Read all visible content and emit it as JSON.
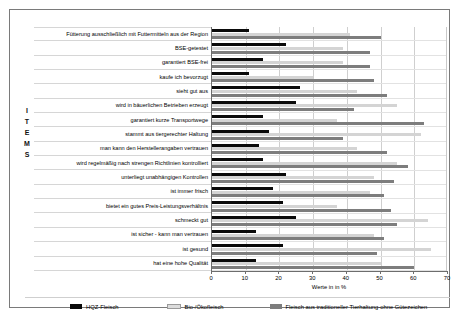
{
  "chart_data": {
    "type": "bar",
    "orientation": "horizontal",
    "title": "",
    "xlabel": "Werte in in %",
    "ylabel": "ITEMS",
    "xlim": [
      0,
      70
    ],
    "xticks": [
      0,
      10,
      20,
      30,
      40,
      50,
      60,
      70
    ],
    "grid": true,
    "legend_position": "bottom",
    "categories": [
      "Fütterung ausschließlich mit Futtermitteln aus der Region",
      "BSE-getestet",
      "garantiert BSE-frei",
      "kaufe ich bevorzugt",
      "sieht gut aus",
      "wird in bäuerlichen Betrieben erzeugt",
      "garantiert kurze Transportwege",
      "stammt aus tiergerechter Haltung",
      "man kann den Herstellerangaben vertrauen",
      "wird regelmäßig nach strengen Richtlinien kontrolliert",
      "unterliegt unabhängigen Kontrollen",
      "ist immer frisch",
      "bietet ein gutes Preis-Leistungsverhältnis",
      "schmeckt gut",
      "ist sicher - kann man vertrauen",
      "ist gesund",
      "hat eine hohe Qualität"
    ],
    "series": [
      {
        "name": "HQZ-Fleisch",
        "color": "#0a0a0a",
        "values": [
          11,
          22,
          15,
          11,
          26,
          25,
          15,
          17,
          14,
          15,
          22,
          18,
          21,
          25,
          13,
          21,
          13
        ]
      },
      {
        "name": "Bio-/Ökofleisch",
        "color": "#d4d4d4",
        "values": [
          41,
          39,
          39,
          30,
          43,
          55,
          37,
          62,
          43,
          55,
          48,
          47,
          37,
          64,
          48,
          65,
          50
        ]
      },
      {
        "name": "Fleisch aus traditioneller Tierhaltung-ohne Gütezeichen",
        "color": "#7d7d7d",
        "values": [
          50,
          47,
          47,
          48,
          52,
          42,
          63,
          39,
          52,
          58,
          54,
          51,
          53,
          55,
          51,
          49,
          60
        ]
      }
    ]
  },
  "axis": {
    "y_title_letters": [
      "I",
      "T",
      "E",
      "M",
      "S"
    ]
  }
}
